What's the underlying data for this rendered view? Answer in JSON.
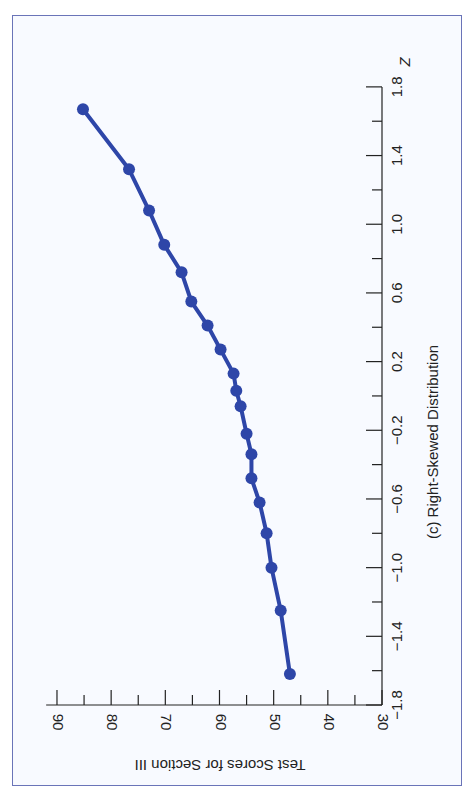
{
  "chart_data": {
    "type": "line",
    "title": "(c) Right-Skewed Distribution",
    "xlabel": "Z",
    "ylabel": "Test Scores for Section III",
    "orientation_note": "figure rotated 90° clockwise",
    "xlim": [
      -1.8,
      1.8
    ],
    "ylim": [
      30,
      90
    ],
    "x_ticks": [
      "-1.8",
      "-1.4",
      "-1.0",
      "-0.6",
      "-0.2",
      "0.2",
      "0.6",
      "1.0",
      "1.4",
      "1.8"
    ],
    "y_ticks": [
      "30",
      "40",
      "50",
      "60",
      "70",
      "80",
      "90"
    ],
    "grid": false,
    "legend": null,
    "series": [
      {
        "name": "Section III",
        "color": "#2e46a8",
        "points": [
          {
            "z": -1.62,
            "score": 47.0
          },
          {
            "z": -1.25,
            "score": 48.7
          },
          {
            "z": -1.0,
            "score": 50.4
          },
          {
            "z": -0.8,
            "score": 51.3
          },
          {
            "z": -0.62,
            "score": 52.6
          },
          {
            "z": -0.48,
            "score": 54.1
          },
          {
            "z": -0.34,
            "score": 54.1
          },
          {
            "z": -0.22,
            "score": 55.0
          },
          {
            "z": -0.06,
            "score": 56.1
          },
          {
            "z": 0.03,
            "score": 56.9
          },
          {
            "z": 0.13,
            "score": 57.4
          },
          {
            "z": 0.27,
            "score": 59.8
          },
          {
            "z": 0.41,
            "score": 62.2
          },
          {
            "z": 0.55,
            "score": 65.2
          },
          {
            "z": 0.72,
            "score": 67.0
          },
          {
            "z": 0.88,
            "score": 70.2
          },
          {
            "z": 1.08,
            "score": 73.0
          },
          {
            "z": 1.32,
            "score": 76.7
          },
          {
            "z": 1.67,
            "score": 85.2
          }
        ]
      }
    ]
  },
  "labels": {
    "caption": "(c) Right-Skewed Distribution",
    "z_axis": "Z",
    "score_axis": "Test Scores for Section III"
  }
}
